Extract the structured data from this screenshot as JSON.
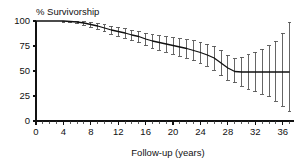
{
  "chart_data": {
    "type": "line",
    "title": "",
    "xlabel": "Follow-up (years)",
    "ylabel": "% Survivorship",
    "xlim": [
      0,
      37.5
    ],
    "ylim": [
      0,
      100
    ],
    "xticks": [
      0,
      4,
      8,
      12,
      16,
      20,
      24,
      28,
      32,
      36
    ],
    "yticks": [
      0,
      25,
      50,
      75,
      100
    ],
    "xtick_minor_step": 1,
    "grid": false,
    "legend": null,
    "series": [
      {
        "name": "Survivorship",
        "x": [
          0,
          1,
          2,
          3,
          4,
          5,
          6,
          7,
          8,
          9,
          10,
          11,
          12,
          13,
          14,
          15,
          16,
          17,
          18,
          19,
          20,
          21,
          22,
          23,
          24,
          25,
          26,
          27,
          28,
          29,
          30,
          31,
          32,
          33,
          34,
          35,
          36,
          37
        ],
        "values": [
          100,
          100,
          100,
          100,
          100,
          99.5,
          99,
          98,
          96.5,
          95,
          93,
          91,
          89.5,
          88,
          86,
          84.5,
          82,
          80,
          78.5,
          77,
          75.5,
          74,
          72.5,
          70.5,
          68.5,
          66,
          63,
          58,
          53,
          49.5,
          49,
          49,
          49,
          49,
          49,
          49,
          49,
          49
        ],
        "ci_lower": [
          100,
          100,
          100,
          99.5,
          99,
          98.5,
          97.5,
          96,
          94,
          92,
          89.5,
          87,
          85,
          83,
          80.5,
          78.5,
          75.5,
          73,
          71,
          69,
          67,
          65,
          63,
          60.5,
          58,
          55,
          51,
          45.5,
          41,
          38.5,
          35,
          32,
          29.5,
          27,
          24.5,
          20,
          15,
          10
        ],
        "ci_upper": [
          100,
          100,
          100,
          100,
          100,
          100,
          100,
          99.5,
          99,
          98,
          96.5,
          95,
          94,
          92.5,
          91,
          90,
          88,
          86.5,
          85.5,
          84.5,
          83.5,
          82.5,
          81.5,
          80.5,
          79,
          77,
          75,
          71,
          66,
          62.5,
          64,
          66.5,
          69,
          72,
          75.5,
          80,
          88,
          99
        ]
      }
    ]
  },
  "axis": {
    "y_title": "% Survivorship",
    "x_title": "Follow-up (years)"
  }
}
